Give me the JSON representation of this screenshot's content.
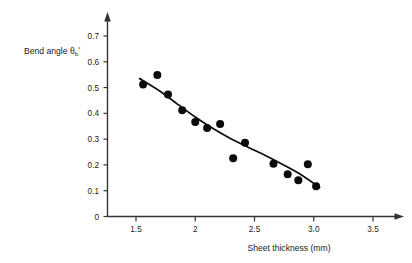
{
  "chart_data": {
    "type": "scatter",
    "title": "",
    "subtitle": "",
    "xlabel": "Sheet thickness (mm)",
    "ylabel": "Bend angle",
    "ylabel_symbol": "θ",
    "ylabel_subscript": "b",
    "ylabel_superscript": "°",
    "xlim": [
      1.25,
      3.62
    ],
    "ylim": [
      0,
      0.74
    ],
    "grid": false,
    "legend": null,
    "xticks": [
      1.5,
      2,
      2.5,
      3.0,
      3.5
    ],
    "xtick_labels": [
      "1.5",
      "2",
      "2.5",
      "3.0",
      "3.5"
    ],
    "yticks": [
      0,
      0.1,
      0.2,
      0.3,
      0.4,
      0.5,
      0.6,
      0.7
    ],
    "ytick_labels": [
      "0",
      "0.1",
      "0.2",
      "0.3",
      "0.4",
      "0.5",
      "0.6",
      "0.7"
    ],
    "series": [
      {
        "name": "measured bend angle",
        "marker": "filled-circle",
        "color": "#0b0b0b",
        "points": [
          {
            "x": 1.56,
            "y": 0.512
          },
          {
            "x": 1.68,
            "y": 0.549
          },
          {
            "x": 1.77,
            "y": 0.473
          },
          {
            "x": 1.89,
            "y": 0.412
          },
          {
            "x": 2.0,
            "y": 0.366
          },
          {
            "x": 2.1,
            "y": 0.343
          },
          {
            "x": 2.21,
            "y": 0.359
          },
          {
            "x": 2.32,
            "y": 0.226
          },
          {
            "x": 2.42,
            "y": 0.286
          },
          {
            "x": 2.66,
            "y": 0.205
          },
          {
            "x": 2.78,
            "y": 0.164
          },
          {
            "x": 2.87,
            "y": 0.141
          },
          {
            "x": 2.95,
            "y": 0.203
          },
          {
            "x": 3.02,
            "y": 0.117
          }
        ]
      },
      {
        "name": "fitted trend curve",
        "marker": "line",
        "color": "#0b0b0b",
        "points": [
          {
            "x": 1.53,
            "y": 0.535
          },
          {
            "x": 1.7,
            "y": 0.487
          },
          {
            "x": 1.85,
            "y": 0.436
          },
          {
            "x": 2.0,
            "y": 0.386
          },
          {
            "x": 2.15,
            "y": 0.341
          },
          {
            "x": 2.3,
            "y": 0.302
          },
          {
            "x": 2.45,
            "y": 0.268
          },
          {
            "x": 2.6,
            "y": 0.235
          },
          {
            "x": 2.75,
            "y": 0.199
          },
          {
            "x": 2.9,
            "y": 0.16
          },
          {
            "x": 3.05,
            "y": 0.112
          }
        ]
      }
    ]
  },
  "axes": {
    "x_axis_name": "x-axis",
    "y_axis_name": "y-axis"
  }
}
